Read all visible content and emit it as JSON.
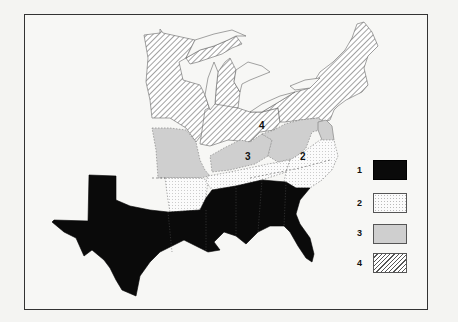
{
  "map": {
    "subject": "Eastern United States by category",
    "region_labels": [
      {
        "id": "label-4",
        "text": "4",
        "x": 259,
        "y": 120
      },
      {
        "id": "label-3",
        "text": "3",
        "x": 245,
        "y": 151
      },
      {
        "id": "label-2",
        "text": "2",
        "x": 300,
        "y": 151
      }
    ],
    "categories": {
      "1": {
        "fill": "#0a0a0a",
        "pattern": "solid-black",
        "regions": [
          "Texas",
          "Louisiana",
          "Mississippi",
          "Alabama",
          "Georgia",
          "South Carolina",
          "Florida"
        ]
      },
      "2": {
        "fill": "#fbfbfb",
        "pattern": "dotted",
        "regions": [
          "Arkansas",
          "Tennessee",
          "North Carolina"
        ]
      },
      "3": {
        "fill": "#cfcfcf",
        "pattern": "light-gray",
        "regions": [
          "Missouri",
          "Kentucky",
          "West Virginia",
          "Virginia",
          "Maryland",
          "Delaware"
        ]
      },
      "4": {
        "fill": "#ffffff",
        "pattern": "diagonal-hatch",
        "regions": [
          "Minnesota",
          "Wisconsin",
          "Iowa",
          "Illinois",
          "Michigan",
          "Indiana",
          "Ohio",
          "Pennsylvania",
          "New York",
          "New Jersey",
          "Connecticut",
          "Rhode Island",
          "Massachusetts",
          "Vermont",
          "New Hampshire",
          "Maine"
        ]
      }
    }
  },
  "legend": {
    "items": [
      {
        "label": "1",
        "swatch": "solid-black",
        "color": "#0a0a0a"
      },
      {
        "label": "2",
        "swatch": "dotted",
        "color": "#fbfbfb"
      },
      {
        "label": "3",
        "swatch": "light-gray",
        "color": "#cfcfcf"
      },
      {
        "label": "4",
        "swatch": "diagonal-hatch",
        "color": "#555555"
      }
    ]
  }
}
